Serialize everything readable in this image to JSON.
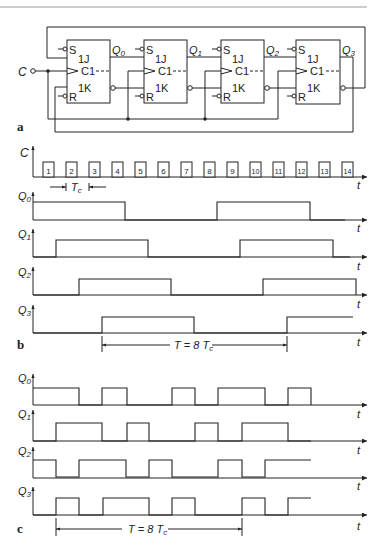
{
  "figure": {
    "panels": [
      "a",
      "b",
      "c"
    ]
  },
  "circuit": {
    "input_label": "C",
    "flipflops": [
      {
        "S": "S",
        "J": "1J",
        "C": "C1",
        "K": "1K",
        "R": "R",
        "out": "Q",
        "sub": "0"
      },
      {
        "S": "S",
        "J": "1J",
        "C": "C1",
        "K": "1K",
        "R": "R",
        "out": "Q",
        "sub": "1"
      },
      {
        "S": "S",
        "J": "1J",
        "C": "C1",
        "K": "1K",
        "R": "R",
        "out": "Q",
        "sub": "2"
      },
      {
        "S": "S",
        "J": "1J",
        "C": "C1",
        "K": "1K",
        "R": "R",
        "out": "Q",
        "sub": "3"
      }
    ],
    "panel_label": "a"
  },
  "timing_b": {
    "panel_label": "b",
    "clock_label": "C",
    "clock_pulses": [
      "1",
      "2",
      "3",
      "4",
      "5",
      "6",
      "7",
      "8",
      "9",
      "10",
      "11",
      "12",
      "13",
      "14"
    ],
    "tc_label": "T",
    "tc_sub": "c",
    "axis_label": "t",
    "signals": [
      {
        "name": "Q",
        "sub": "0"
      },
      {
        "name": "Q",
        "sub": "1"
      },
      {
        "name": "Q",
        "sub": "2"
      },
      {
        "name": "Q",
        "sub": "3"
      }
    ],
    "period_label": "T = 8 T",
    "period_sub": "c"
  },
  "timing_c": {
    "panel_label": "c",
    "axis_label": "t",
    "signals": [
      {
        "name": "Q",
        "sub": "0"
      },
      {
        "name": "Q",
        "sub": "1"
      },
      {
        "name": "Q",
        "sub": "2"
      },
      {
        "name": "Q",
        "sub": "3"
      }
    ],
    "period_label": "T = 8 T",
    "period_sub": "c"
  }
}
